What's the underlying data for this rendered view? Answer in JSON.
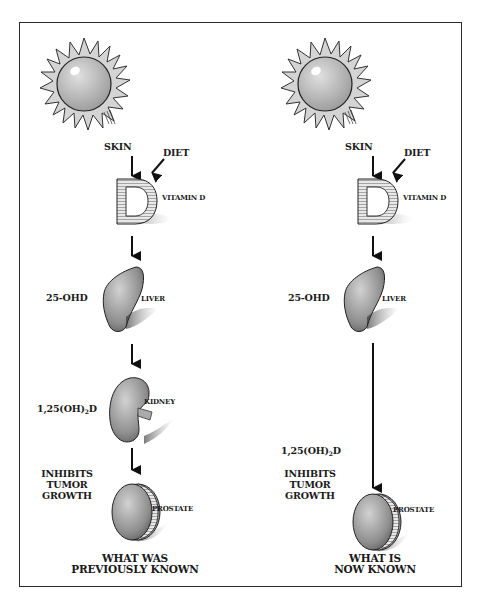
{
  "diagram": {
    "type": "vitamin-d-metabolism-comparison",
    "panels": [
      {
        "id": "left",
        "caption_line1": "WHAT WAS",
        "caption_line2": "PREVIOUSLY KNOWN",
        "labels": {
          "skin": "SKIN",
          "diet": "DIET",
          "vitamin_d": "VITAMIN D",
          "liver_metabolite": "25-OHD",
          "liver": "LIVER",
          "kidney_metabolite_prefix": "1,25(OH)",
          "kidney_metabolite_sub": "2",
          "kidney_metabolite_suffix": "D",
          "kidney": "KIDNEY",
          "effect_line1": "INHIBITS",
          "effect_line2": "TUMOR",
          "effect_line3": "GROWTH",
          "prostate": "PROSTATE"
        },
        "flow": [
          "Sun/Skin",
          "Diet",
          "Vitamin D",
          "Liver (25-OHD)",
          "Kidney (1,25(OH)2D)",
          "Prostate"
        ]
      },
      {
        "id": "right",
        "caption_line1": "WHAT IS",
        "caption_line2": "NOW KNOWN",
        "labels": {
          "skin": "SKIN",
          "diet": "DIET",
          "vitamin_d": "VITAMIN D",
          "liver_metabolite": "25-OHD",
          "liver": "LIVER",
          "prostate_metabolite_prefix": "1,25(OH)",
          "prostate_metabolite_sub": "2",
          "prostate_metabolite_suffix": "D",
          "effect_line1": "INHIBITS",
          "effect_line2": "TUMOR",
          "effect_line3": "GROWTH",
          "prostate": "PROSTATE"
        },
        "flow": [
          "Sun/Skin",
          "Diet",
          "Vitamin D",
          "Liver (25-OHD)",
          "Prostate (1,25(OH)2D)"
        ]
      }
    ],
    "colors": {
      "frame": "#2a2a2a",
      "ink": "#1a1a1a",
      "organ_fill": "#a8a8a8",
      "sun_fill": "#c8c8c8"
    }
  }
}
